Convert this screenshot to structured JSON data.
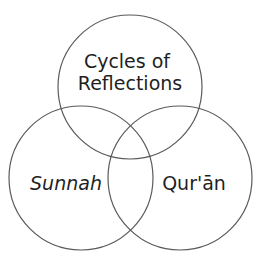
{
  "diagram": {
    "type": "venn",
    "colors": {
      "stroke": "#5a5a5a",
      "text": "#1f1f1f",
      "background": "#ffffff"
    },
    "circles": [
      {
        "id": "top",
        "label_lines": [
          "Cycles of",
          "Reflections"
        ],
        "italic": false,
        "cx": 130,
        "cy": 87,
        "r": 72
      },
      {
        "id": "left",
        "label_lines": [
          "Sunnah"
        ],
        "italic": true,
        "cx": 81,
        "cy": 178,
        "r": 72
      },
      {
        "id": "right",
        "label_lines": [
          "Qur'ān"
        ],
        "italic": false,
        "cx": 180,
        "cy": 178,
        "r": 72
      }
    ]
  }
}
